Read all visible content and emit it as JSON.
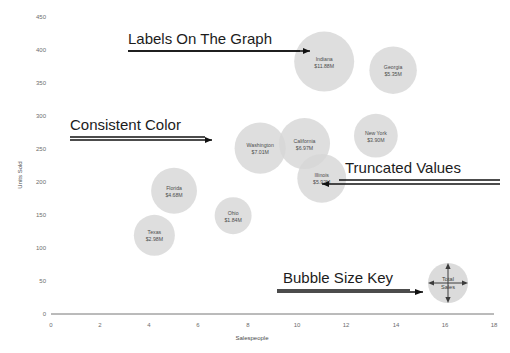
{
  "chart_data": {
    "type": "scatter",
    "variant": "bubble",
    "title": "",
    "xlabel": "Salespeople",
    "ylabel": "Units Sold",
    "xlim": [
      0,
      18
    ],
    "ylim": [
      0,
      450
    ],
    "xticks": [
      0,
      2,
      4,
      6,
      8,
      10,
      12,
      14,
      16,
      18
    ],
    "yticks": [
      0,
      50,
      100,
      150,
      200,
      250,
      300,
      350,
      400,
      450
    ],
    "grid": false,
    "legend": "none",
    "bubble_color": "#d7d7d7",
    "size_metric": "Total Sales",
    "points": [
      {
        "label": "Indiana",
        "value_label": "$11.88M",
        "x": 11.1,
        "y": 385,
        "size": 11.88
      },
      {
        "label": "Georgia",
        "value_label": "$5.35M",
        "x": 13.9,
        "y": 372,
        "size": 5.35
      },
      {
        "label": "Washington",
        "value_label": "$7.01M",
        "x": 8.5,
        "y": 253,
        "size": 7.01
      },
      {
        "label": "California",
        "value_label": "$6.97M",
        "x": 10.3,
        "y": 260,
        "size": 6.97
      },
      {
        "label": "New York",
        "value_label": "$3.90M",
        "x": 13.2,
        "y": 272,
        "size": 3.9
      },
      {
        "label": "Illinois",
        "value_label": "$5.92M",
        "x": 11.0,
        "y": 207,
        "size": 5.92
      },
      {
        "label": "Florida",
        "value_label": "$4.68M",
        "x": 5.0,
        "y": 188,
        "size": 4.68
      },
      {
        "label": "Ohio",
        "value_label": "$1.84M",
        "x": 7.4,
        "y": 150,
        "size": 1.84
      },
      {
        "label": "Texas",
        "value_label": "$2.98M",
        "x": 4.2,
        "y": 120,
        "size": 2.98
      }
    ]
  },
  "annotations": [
    {
      "id": "labels-on-the-graph",
      "text": "Labels On The Graph"
    },
    {
      "id": "consistent-color",
      "text": "Consistent Color"
    },
    {
      "id": "truncated-values",
      "text": "Truncated Values"
    },
    {
      "id": "bubble-size-key",
      "text": "Bubble Size Key"
    }
  ],
  "size_key": {
    "line1": "Total",
    "line2": "Sales"
  },
  "axis": {
    "x_title": "Salespeople",
    "y_title": "Units Sold",
    "x_ticks": [
      "0",
      "2",
      "4",
      "6",
      "8",
      "10",
      "12",
      "14",
      "16",
      "18"
    ],
    "y_ticks": [
      "0",
      "50",
      "100",
      "150",
      "200",
      "250",
      "300",
      "350",
      "400",
      "450"
    ]
  }
}
